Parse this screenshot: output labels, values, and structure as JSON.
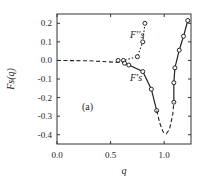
{
  "chart_data": {
    "type": "line",
    "title": "",
    "panel_label": "(a)",
    "xlabel": "q",
    "ylabel": "F_s(q)",
    "xlim": [
      0.0,
      1.25
    ],
    "ylim": [
      -0.45,
      0.25
    ],
    "xticks": [
      0.0,
      0.5,
      1.0
    ],
    "xtick_labels": [
      "0.0",
      "0.5",
      "1.0"
    ],
    "yticks": [
      0.2,
      0.1,
      0.0,
      -0.1,
      -0.2,
      -0.3,
      -0.4
    ],
    "ytick_labels": [
      "0.2",
      "0.1",
      "0.0",
      "-0.1",
      "-0.2",
      "-0.3",
      "-0.4"
    ],
    "grid": false,
    "series": [
      {
        "name": "F_s'' (circles)",
        "label": "F''s",
        "style": "dotted",
        "points": [
          [
            0.57,
            0.0
          ],
          [
            0.62,
            0.0
          ],
          [
            0.75,
            0.02
          ],
          [
            0.8,
            0.1
          ],
          [
            0.82,
            0.2
          ]
        ]
      },
      {
        "name": "F_s' (circles)",
        "label": "F's",
        "style": "solid",
        "points": [
          [
            0.63,
            -0.015
          ],
          [
            0.67,
            -0.025
          ],
          [
            0.8,
            -0.06
          ],
          [
            0.88,
            -0.155
          ],
          [
            0.93,
            -0.27
          ],
          [
            1.09,
            -0.225
          ],
          [
            1.09,
            -0.12
          ],
          [
            1.1,
            -0.04
          ],
          [
            1.14,
            0.055
          ],
          [
            1.18,
            0.13
          ],
          [
            1.22,
            0.215
          ]
        ]
      },
      {
        "name": "dashed curve",
        "style": "dashed",
        "points": [
          [
            0.0,
            0.0
          ],
          [
            0.3,
            -0.002
          ],
          [
            0.55,
            -0.01
          ],
          [
            0.62,
            -0.01
          ]
        ]
      },
      {
        "name": "dashed minimum",
        "style": "dashed",
        "points": [
          [
            0.93,
            -0.27
          ],
          [
            0.96,
            -0.34
          ],
          [
            0.99,
            -0.385
          ],
          [
            1.02,
            -0.395
          ],
          [
            1.05,
            -0.37
          ],
          [
            1.08,
            -0.29
          ],
          [
            1.09,
            -0.225
          ]
        ]
      }
    ],
    "annotations": [
      "F''s",
      "F's",
      "(a)"
    ]
  }
}
